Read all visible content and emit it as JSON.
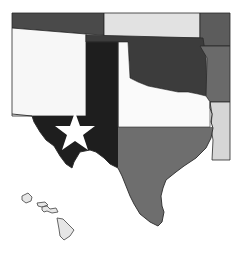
{
  "map": {
    "description": "Grayscale map of south-central US states with Texas painted as the Texas flag, plus Hawaiian islands",
    "colors": {
      "background": "#ffffff",
      "colorado": "#4a4a4a",
      "kansas": "#e2e2e2",
      "missouri": "#5c5c5c",
      "new_mexico": "#f7f7f7",
      "oklahoma": "#3c3c3c",
      "arkansas": "#6a6a6a",
      "louisiana": "#d6d6d6",
      "texas_blue": "#1e1e1e",
      "texas_white": "#fafafa",
      "texas_red": "#6e6e6e",
      "star": "#ffffff",
      "hawaii": "#e6e6e6"
    },
    "regions": [
      {
        "name": "Colorado",
        "fill": "colorado"
      },
      {
        "name": "Kansas",
        "fill": "kansas"
      },
      {
        "name": "Missouri",
        "fill": "missouri"
      },
      {
        "name": "New Mexico",
        "fill": "new_mexico"
      },
      {
        "name": "Oklahoma",
        "fill": "oklahoma"
      },
      {
        "name": "Arkansas",
        "fill": "arkansas"
      },
      {
        "name": "Louisiana",
        "fill": "louisiana"
      },
      {
        "name": "Texas",
        "fill": "texas_flag"
      },
      {
        "name": "Hawaii",
        "fill": "hawaii"
      }
    ]
  }
}
